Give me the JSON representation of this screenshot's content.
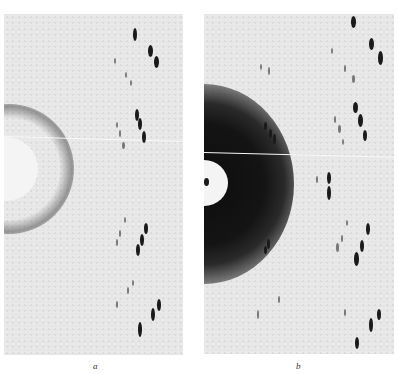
{
  "figure": {
    "panels": [
      {
        "id": "a",
        "label": "a",
        "description": "X-ray diffraction photograph, small central beam stop, no diffuse halo"
      },
      {
        "id": "b",
        "label": "b",
        "description": "X-ray diffraction photograph, beam stop surrounded by dark diffuse scattering halo"
      }
    ],
    "colors": {
      "film_background": "#e6e6e6",
      "spot": "#1a1a1a",
      "halo": "#0d0d0d",
      "beam_stop": "#f4f4f4"
    }
  }
}
